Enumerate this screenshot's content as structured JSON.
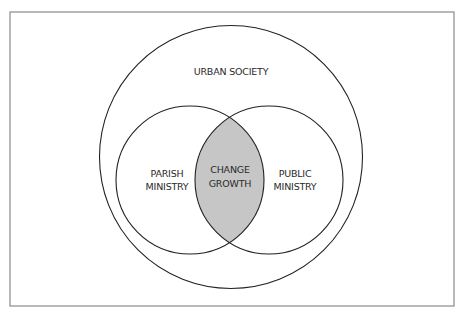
{
  "diagram": {
    "type": "venn",
    "frame": {
      "stroke": "#8a8a8a"
    },
    "outer": {
      "label": "URBAN SOCIETY",
      "stroke": "#222222"
    },
    "left": {
      "line1": "PARISH",
      "line2": "MINISTRY",
      "stroke": "#222222"
    },
    "right": {
      "line1": "PUBLIC",
      "line2": "MINISTRY",
      "stroke": "#222222"
    },
    "intersection": {
      "line1": "CHANGE",
      "line2": "GROWTH",
      "fill": "#c6c6c6"
    }
  }
}
